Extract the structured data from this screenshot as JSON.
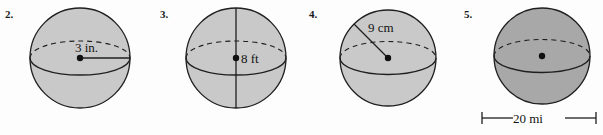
{
  "page": {
    "background_color": "#fdfdfd",
    "width": 603,
    "height": 135,
    "content_type": "geometry-exercise-sphere-figures"
  },
  "style": {
    "sphere_fill_light": "#c9c9c9",
    "sphere_fill_dark": "#a8a8a8",
    "outline_color": "#1f1f1f",
    "text_color": "#141414"
  },
  "problems": [
    {
      "number": "2.",
      "shape": "sphere",
      "measure_type": "radius",
      "measure_label": "3 in.",
      "value": 3,
      "unit": "in.",
      "fill": "#c9c9c9",
      "has_center_dot": true,
      "has_vertical_axis": false,
      "has_scale_bar": false
    },
    {
      "number": "3.",
      "shape": "sphere",
      "measure_type": "diameter",
      "measure_label": "8 ft",
      "value": 8,
      "unit": "ft",
      "fill": "#c9c9c9",
      "has_center_dot": true,
      "has_vertical_axis": true,
      "has_scale_bar": false
    },
    {
      "number": "4.",
      "shape": "sphere",
      "measure_type": "radius",
      "measure_label": "9 cm",
      "value": 9,
      "unit": "cm",
      "fill": "#c9c9c9",
      "has_center_dot": true,
      "has_vertical_axis": false,
      "has_scale_bar": false
    },
    {
      "number": "5.",
      "shape": "sphere",
      "measure_type": "scale-bar-diameter",
      "measure_label": "20 mi",
      "value": 20,
      "unit": "mi",
      "fill": "#a8a8a8",
      "has_center_dot": true,
      "has_vertical_axis": false,
      "has_scale_bar": true
    }
  ]
}
